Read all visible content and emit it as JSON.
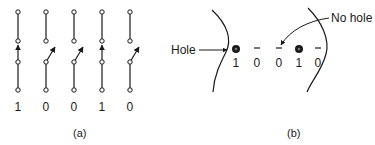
{
  "panel_a": {
    "caption": "(a)",
    "switches": [
      {
        "x": 18,
        "state": "closed",
        "bit": "1"
      },
      {
        "x": 46,
        "state": "open",
        "bit": "0"
      },
      {
        "x": 74,
        "state": "open",
        "bit": "0"
      },
      {
        "x": 102,
        "state": "closed",
        "bit": "1"
      },
      {
        "x": 130,
        "state": "open",
        "bit": "0"
      }
    ]
  },
  "panel_b": {
    "caption": "(b)",
    "hole_label": "Hole",
    "no_hole_label": "No hole",
    "positions": [
      {
        "x": 236,
        "mark": "hole",
        "bit": "1"
      },
      {
        "x": 257,
        "mark": "no-hole",
        "bit": "0"
      },
      {
        "x": 279,
        "mark": "no-hole",
        "bit": "0"
      },
      {
        "x": 299,
        "mark": "hole",
        "bit": "1"
      },
      {
        "x": 318,
        "mark": "no-hole",
        "bit": "0"
      }
    ]
  },
  "colors": {
    "ink": "#1a1a1a",
    "background": "#ffffff"
  }
}
